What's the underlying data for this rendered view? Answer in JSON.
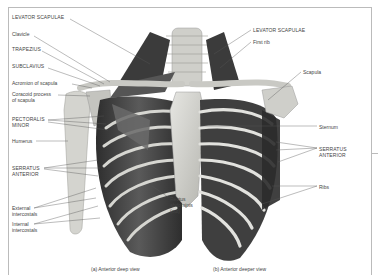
{
  "figure": {
    "left_labels": [
      {
        "id": "levator-scapulae-left",
        "text": "LEVATOR SCAPULAE",
        "x": 12,
        "y": 17
      },
      {
        "id": "clavicle",
        "text": "Clavicle",
        "x": 12,
        "y": 34
      },
      {
        "id": "trapezius",
        "text": "TRAPEZIUS",
        "x": 12,
        "y": 49
      },
      {
        "id": "subclavius",
        "text": "SUBCLAVIUS",
        "x": 12,
        "y": 66
      },
      {
        "id": "acromion",
        "text": "Acromion of scapula",
        "x": 12,
        "y": 82
      },
      {
        "id": "coracoid",
        "text": "Coracoid process",
        "text2": "of scapula",
        "x": 12,
        "y": 93
      },
      {
        "id": "pectoralis-minor",
        "text": "PECTORALIS",
        "text2": "MINOR",
        "x": 12,
        "y": 119
      },
      {
        "id": "humerus",
        "text": "Humerus",
        "x": 12,
        "y": 139
      },
      {
        "id": "serratus-anterior-left",
        "text": "SERRATUS",
        "text2": "ANTERIOR",
        "x": 12,
        "y": 166
      },
      {
        "id": "external-intercostals",
        "text": "External",
        "text2": "intercostals",
        "x": 12,
        "y": 206
      },
      {
        "id": "internal-intercostals",
        "text": "Internal",
        "text2": "intercostals",
        "x": 12,
        "y": 222
      }
    ],
    "right_labels": [
      {
        "id": "levator-scapulae-right",
        "text": "LEVATOR SCAPULAE",
        "x": 253,
        "y": 28
      },
      {
        "id": "first-rib",
        "text": "First rib",
        "x": 253,
        "y": 40
      },
      {
        "id": "scapula",
        "text": "Scapula",
        "x": 303,
        "y": 70
      },
      {
        "id": "sternum",
        "text": "Sternum",
        "x": 319,
        "y": 124
      },
      {
        "id": "serratus-anterior-right",
        "text": "SERRATUS",
        "text2": "ANTERIOR",
        "x": 319,
        "y": 145
      },
      {
        "id": "ribs",
        "text": "Ribs",
        "x": 319,
        "y": 184
      }
    ],
    "center_labels": [
      {
        "id": "rectus-abdominis",
        "text": "Rectus",
        "text2": "abdominis",
        "text3": "(cut)",
        "x": 169,
        "y": 200
      }
    ],
    "captions": {
      "a": "(a) Anterior deep view",
      "b": "(b) Anterior deeper view"
    },
    "colors": {
      "muscle_dark": "#3a3a3a",
      "muscle_mid": "#6e6e6e",
      "bone": "#d8d8d4",
      "bone_shadow": "#a9a9a4",
      "frame": "#bbbbbb"
    }
  }
}
